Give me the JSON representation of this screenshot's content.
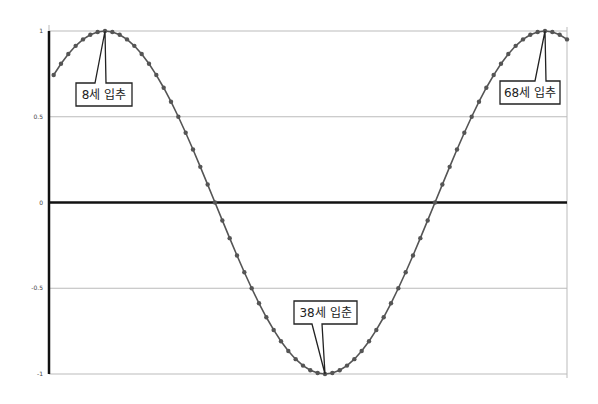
{
  "chart_data": {
    "type": "line",
    "title": "",
    "xlabel": "",
    "ylabel": "",
    "ylim": [
      -1,
      1
    ],
    "yticks": [
      "1",
      "0.5",
      "0",
      "-0.5",
      "-1"
    ],
    "ytick_values": [
      1,
      0.5,
      0,
      -0.5,
      -1
    ],
    "grid": true,
    "legend": "none",
    "series": [
      {
        "name": "cycle",
        "formula": "cos(2*pi*(age-8)/60)",
        "x_start": 1,
        "x_end": 71,
        "x_step": 1,
        "marker": "circle",
        "color": "#555555"
      }
    ],
    "annotations": [
      {
        "label": "8세 입추",
        "x": 8,
        "y": 1
      },
      {
        "label": "38세 입춘",
        "x": 38,
        "y": -1
      },
      {
        "label": "68세 입추",
        "x": 68,
        "y": 1
      }
    ]
  },
  "colors": {
    "line": "#555555",
    "marker": "#555555",
    "axis": "#111111",
    "grid": "#bbbbbb"
  }
}
